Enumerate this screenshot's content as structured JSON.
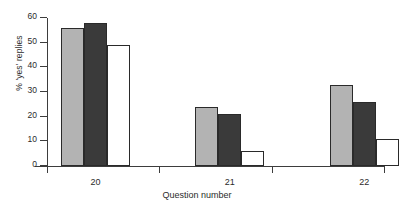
{
  "chart_data": {
    "type": "bar",
    "title": "",
    "subtitle": "",
    "xlabel": "Question number",
    "ylabel": "% 'yes' replies",
    "categories": [
      "20",
      "21",
      "22"
    ],
    "ylim": [
      0,
      60
    ],
    "yticks": [
      0,
      10,
      20,
      30,
      40,
      50,
      60
    ],
    "grid": false,
    "legend": "none",
    "series": [
      {
        "name": "series-1",
        "color": "#b3b3b3",
        "values": [
          56,
          24,
          33
        ]
      },
      {
        "name": "series-2",
        "color": "#3a3a3a",
        "values": [
          58,
          21,
          26
        ]
      },
      {
        "name": "series-3",
        "color": "#ffffff",
        "values": [
          49,
          6,
          11
        ]
      }
    ]
  },
  "axes": {
    "y": {
      "label": "% 'yes' replies",
      "ticks": [
        {
          "value": 0,
          "label": "0"
        },
        {
          "value": 10,
          "label": "10"
        },
        {
          "value": 20,
          "label": "20"
        },
        {
          "value": 30,
          "label": "30"
        },
        {
          "value": 40,
          "label": "40"
        },
        {
          "value": 50,
          "label": "50"
        },
        {
          "value": 60,
          "label": "60"
        }
      ]
    },
    "x": {
      "label": "Question number",
      "categories": [
        {
          "label": "20"
        },
        {
          "label": "21"
        },
        {
          "label": "22"
        }
      ]
    }
  },
  "colors": {
    "bar_light": "#b3b3b3",
    "bar_dark": "#3a3a3a",
    "bar_white": "#ffffff",
    "outline": "#2a2a2a",
    "axis": "#3d3d3d",
    "text": "#2b2b2b",
    "background": "#ffffff"
  }
}
